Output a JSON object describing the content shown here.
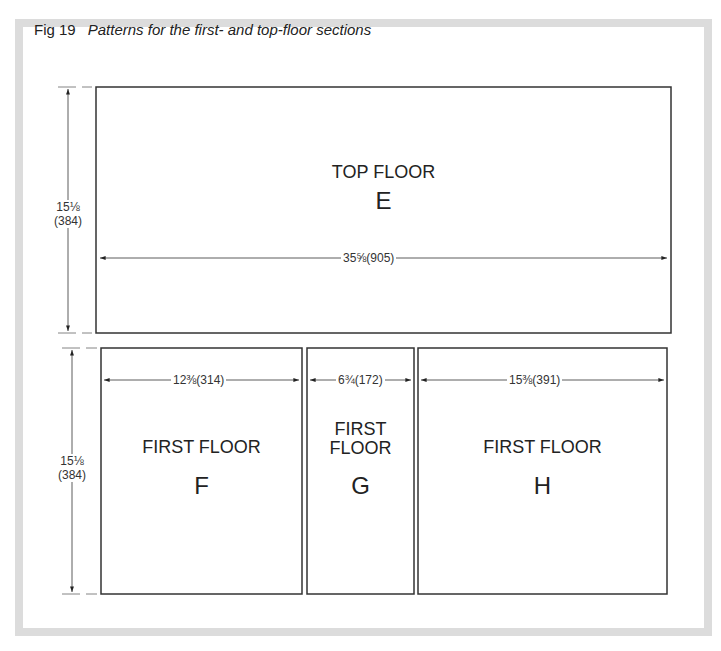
{
  "figure": {
    "number": "Fig 19",
    "title": "Patterns for the first- and top-floor sections"
  },
  "panels": {
    "top": {
      "name": "TOP FLOOR",
      "letter": "E",
      "width_dim": "35⅝(905)",
      "height_dim_in": "15⅛",
      "height_dim_mm": "(384)"
    },
    "lower_height": {
      "in": "15⅛",
      "mm": "(384)"
    },
    "f": {
      "name": "FIRST FLOOR",
      "letter": "F",
      "width_dim": "12⅜(314)"
    },
    "g": {
      "name_line1": "FIRST",
      "name_line2": "FLOOR",
      "letter": "G",
      "width_dim": "6¾(172)"
    },
    "h": {
      "name": "FIRST FLOOR",
      "letter": "H",
      "width_dim": "15⅜(391)"
    }
  },
  "colors": {
    "frame": "#dcdcdc",
    "line": "#333333"
  }
}
